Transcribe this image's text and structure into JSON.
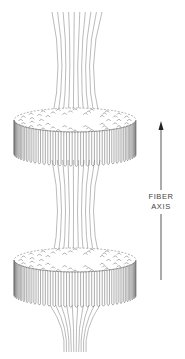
{
  "figure": {
    "axis_label_line1": "FIBER",
    "axis_label_line2": "AXIS",
    "arrow_direction": "up",
    "disc_count": 2,
    "colors": {
      "line": "#555555",
      "background": "#ffffff"
    }
  }
}
